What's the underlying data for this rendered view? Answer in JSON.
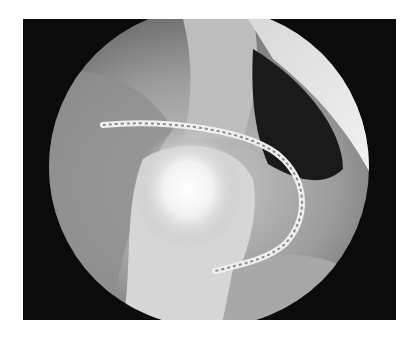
{
  "image": {
    "subject": "arthroscopic view with braided suture loop",
    "mode": "grayscale",
    "colors": {
      "background": "#ffffff",
      "frame": "#0b0b0b",
      "tissue": "#9a9a9a",
      "highlight": "#ffffff",
      "suture": "#e6e6e6"
    }
  }
}
